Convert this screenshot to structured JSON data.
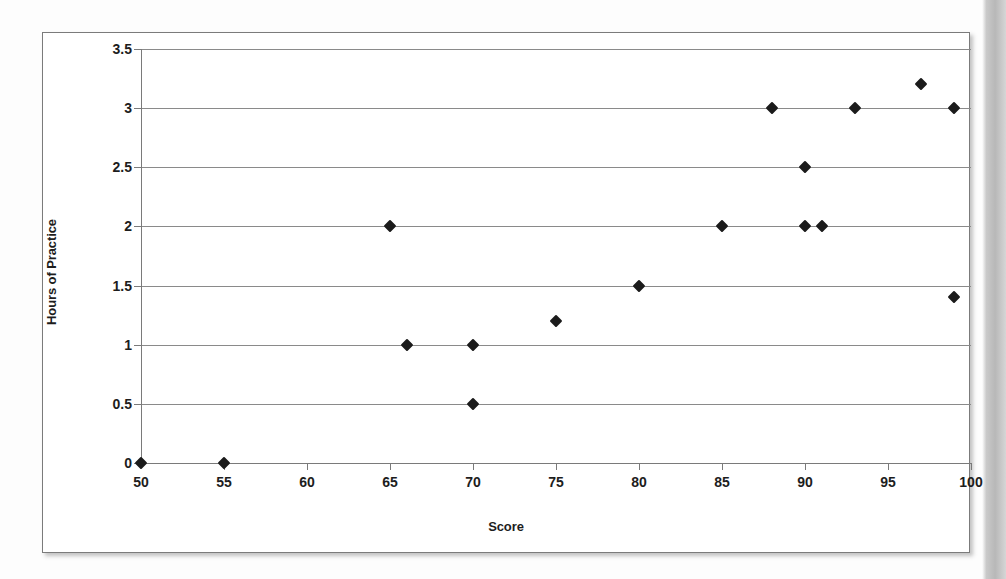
{
  "chart_data": {
    "type": "scatter",
    "title": "",
    "xlabel": "Score",
    "ylabel": "Hours of Practice",
    "xlim": [
      50,
      100
    ],
    "ylim": [
      0,
      3.5
    ],
    "xticks": [
      50,
      55,
      60,
      65,
      70,
      75,
      80,
      85,
      90,
      95,
      100
    ],
    "yticks": [
      0,
      0.5,
      1,
      1.5,
      2,
      2.5,
      3,
      3.5
    ],
    "xtick_labels": [
      "50",
      "55",
      "60",
      "65",
      "70",
      "75",
      "80",
      "85",
      "90",
      "95",
      "100"
    ],
    "ytick_labels": [
      "0",
      "0.5",
      "1",
      "1.5",
      "2",
      "2.5",
      "3",
      "3.5"
    ],
    "grid": "horizontal",
    "legend": "none",
    "marker": "diamond",
    "marker_color": "#1b1b1b",
    "gridline_color": "#8a8a8a",
    "series": [
      {
        "name": "Hours of Practice vs Score",
        "points": [
          {
            "x": 50,
            "y": 0
          },
          {
            "x": 55,
            "y": 0
          },
          {
            "x": 65,
            "y": 2
          },
          {
            "x": 66,
            "y": 1
          },
          {
            "x": 70,
            "y": 1
          },
          {
            "x": 70,
            "y": 0.5
          },
          {
            "x": 75,
            "y": 1.2
          },
          {
            "x": 80,
            "y": 1.5
          },
          {
            "x": 85,
            "y": 2
          },
          {
            "x": 88,
            "y": 3
          },
          {
            "x": 90,
            "y": 2
          },
          {
            "x": 90,
            "y": 2.5
          },
          {
            "x": 91,
            "y": 2
          },
          {
            "x": 93,
            "y": 3
          },
          {
            "x": 97,
            "y": 3.2
          },
          {
            "x": 99,
            "y": 3
          },
          {
            "x": 99,
            "y": 1.4
          }
        ]
      }
    ]
  }
}
